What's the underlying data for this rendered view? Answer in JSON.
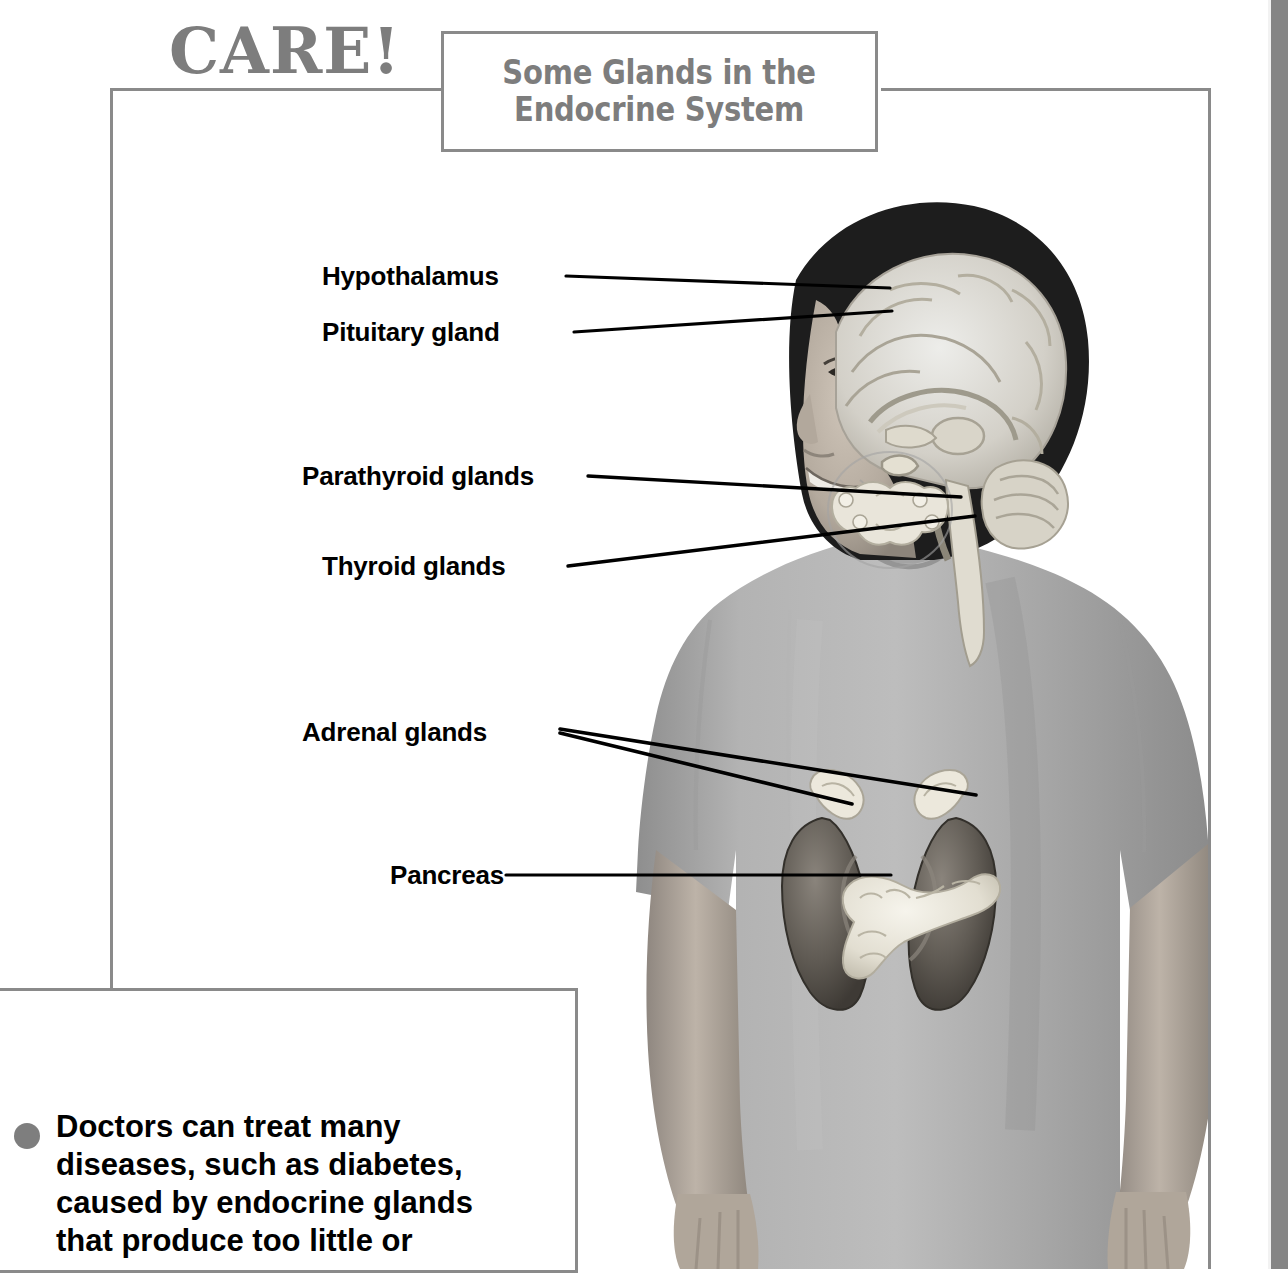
{
  "page": {
    "background_color": "#ffffff",
    "frame_color": "#8a8a8a",
    "edge_band_color": "#858585"
  },
  "title_box": {
    "text": "Some Glands in the\nEndocrine System",
    "color": "#7d7d7d"
  },
  "diagram": {
    "labels": [
      {
        "name": "hypothalamus",
        "text": "Hypothalamus",
        "x": 322,
        "y": 261
      },
      {
        "name": "pituitary-gland",
        "text": "Pituitary gland",
        "x": 322,
        "y": 317
      },
      {
        "name": "parathyroid-glands",
        "text": "Parathyroid glands",
        "x": 302,
        "y": 461
      },
      {
        "name": "thyroid-glands",
        "text": "Thyroid glands",
        "x": 322,
        "y": 551
      },
      {
        "name": "adrenal-glands",
        "text": "Adrenal glands",
        "x": 302,
        "y": 717
      },
      {
        "name": "pancreas",
        "text": "Pancreas",
        "x": 390,
        "y": 860
      }
    ],
    "leader_lines": [
      {
        "name": "hypothalamus-leader",
        "points": "566,276 890,288"
      },
      {
        "name": "pituitary-leader",
        "points": "574,332 892,311"
      },
      {
        "name": "parathyroid-leader",
        "points": "588,476 961,497"
      },
      {
        "name": "thyroid-leader",
        "points": "568,566 975,516"
      },
      {
        "name": "adrenal-leader-left",
        "points": "560,732 850,803"
      },
      {
        "name": "adrenal-leader-right",
        "points": "560,730 974,795"
      },
      {
        "name": "pancreas-leader",
        "points": "506,875 891,875"
      }
    ],
    "organ_colors": {
      "brain": "#d8d6cf",
      "kidney": "#6c6862",
      "pancreas": "#efece2",
      "thyroid": "#e6e2d8",
      "shirt": "#a9a9a9",
      "skin": "#b9b0a6",
      "hair": "#1b1b1b"
    }
  },
  "care_box": {
    "heading": "CARE!",
    "heading_color": "#7d7d7d",
    "bullet_color": "#7e7e7e",
    "body": "Doctors can treat many\ndiseases, such as diabetes,\ncaused by endocrine glands\nthat produce too little or"
  }
}
